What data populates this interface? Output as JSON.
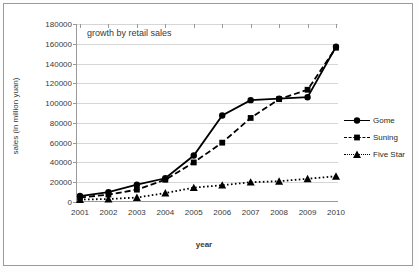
{
  "chart_data": {
    "type": "line",
    "title": "growth by retail sales",
    "xlabel": "year",
    "ylabel": "sales (in million yuan)",
    "categories": [
      "2001",
      "2002",
      "2003",
      "2004",
      "2005",
      "2006",
      "2007",
      "2008",
      "2009",
      "2010"
    ],
    "x": [
      2001,
      2002,
      2003,
      2004,
      2005,
      2006,
      2007,
      2008,
      2009,
      2010
    ],
    "ylim": [
      0,
      180000
    ],
    "xlim": [
      2001,
      2010
    ],
    "yticks": [
      0,
      20000,
      40000,
      60000,
      80000,
      100000,
      120000,
      140000,
      160000,
      180000
    ],
    "grid": true,
    "legend_position": "right",
    "series": [
      {
        "name": "Gome",
        "marker": "circle",
        "line_style": "solid",
        "color": "#000000",
        "values": [
          6000,
          10000,
          17500,
          24000,
          47000,
          87500,
          103000,
          104500,
          106000,
          157000
        ]
      },
      {
        "name": "Suning",
        "marker": "square",
        "line_style": "dashed",
        "color": "#000000",
        "values": [
          4500,
          7500,
          12500,
          22500,
          40000,
          60000,
          85000,
          104000,
          113500,
          156000
        ]
      },
      {
        "name": "Five Star",
        "marker": "triangle",
        "line_style": "dotted",
        "color": "#000000",
        "values": [
          2500,
          3000,
          4500,
          9000,
          14500,
          17000,
          20000,
          21000,
          23500,
          26000
        ]
      }
    ]
  }
}
